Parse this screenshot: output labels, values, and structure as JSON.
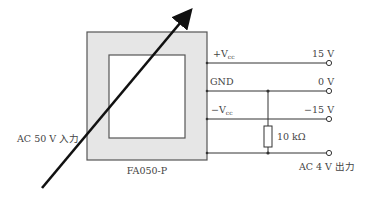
{
  "diagram": {
    "sensor_label": "FA050-P",
    "input_label": "AC 50 V 入力",
    "pins": [
      {
        "name": "+V",
        "sub": "cc",
        "value": "15 V",
        "y": 63
      },
      {
        "name": "GND",
        "sub": "",
        "value": "0 V",
        "y": 91
      },
      {
        "name": "−V",
        "sub": "cc",
        "value": "−15 V",
        "y": 119
      },
      {
        "name": "",
        "sub": "",
        "value": "AC 4 V 出力",
        "y": 153
      }
    ],
    "resistor_label": "10 kΩ",
    "colors": {
      "line": "#222222",
      "core_fill": "#e6e6e6",
      "core_stroke": "#555555",
      "text": "#444444"
    }
  }
}
